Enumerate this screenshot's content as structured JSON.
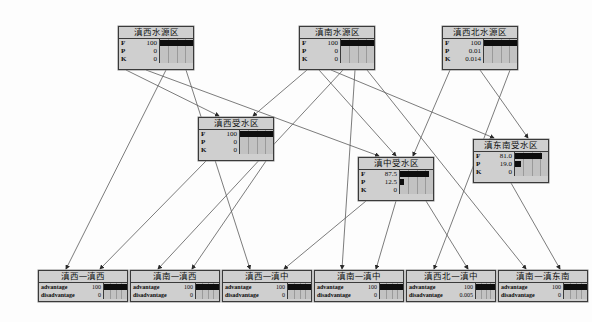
{
  "diagram": {
    "type": "bayesian-network",
    "title": "",
    "background_color": "#fdfdfd",
    "node_fill": "#cfcfcf",
    "node_border": "#3a3a3a",
    "bar_color": "#0d0d0d",
    "edge_color": "#5a5a5a"
  },
  "nodes": [
    {
      "id": "n1",
      "name": "滇西水源区",
      "x": 118,
      "y": 26,
      "w": 76,
      "h": 44,
      "label_w": 14,
      "value_w": 26,
      "states": [
        {
          "label": "F",
          "value": "100",
          "pct": 100
        },
        {
          "label": "P",
          "value": "0",
          "pct": 0
        },
        {
          "label": "K",
          "value": "0",
          "pct": 0
        }
      ]
    },
    {
      "id": "n2",
      "name": "滇南水源区",
      "x": 299,
      "y": 26,
      "w": 76,
      "h": 44,
      "label_w": 14,
      "value_w": 26,
      "states": [
        {
          "label": "F",
          "value": "100",
          "pct": 100
        },
        {
          "label": "P",
          "value": "0",
          "pct": 0
        },
        {
          "label": "K",
          "value": "0",
          "pct": 0
        }
      ]
    },
    {
      "id": "n3",
      "name": "滇西北水源区",
      "x": 442,
      "y": 26,
      "w": 76,
      "h": 44,
      "label_w": 12,
      "value_w": 28,
      "states": [
        {
          "label": "F",
          "value": "100",
          "pct": 100
        },
        {
          "label": "P",
          "value": "0.01",
          "pct": 0
        },
        {
          "label": "K",
          "value": "0.014",
          "pct": 0
        }
      ]
    },
    {
      "id": "n4",
      "name": "滇西受水区",
      "x": 198,
      "y": 117,
      "w": 76,
      "h": 44,
      "label_w": 14,
      "value_w": 26,
      "states": [
        {
          "label": "F",
          "value": "100",
          "pct": 100
        },
        {
          "label": "P",
          "value": "0",
          "pct": 0
        },
        {
          "label": "K",
          "value": "0",
          "pct": 0
        }
      ]
    },
    {
      "id": "n5",
      "name": "滇中受水区",
      "x": 358,
      "y": 157,
      "w": 76,
      "h": 44,
      "label_w": 14,
      "value_w": 26,
      "states": [
        {
          "label": "F",
          "value": "87.5",
          "pct": 87.5
        },
        {
          "label": "P",
          "value": "12.5",
          "pct": 12.5
        },
        {
          "label": "K",
          "value": "0",
          "pct": 0
        }
      ]
    },
    {
      "id": "n6",
      "name": "滇东南受水区",
      "x": 473,
      "y": 139,
      "w": 76,
      "h": 44,
      "label_w": 12,
      "value_w": 28,
      "states": [
        {
          "label": "F",
          "value": "81.0",
          "pct": 81
        },
        {
          "label": "P",
          "value": "19.0",
          "pct": 19
        },
        {
          "label": "K",
          "value": "0",
          "pct": 0
        }
      ]
    },
    {
      "id": "b1",
      "name": "滇西—滇西",
      "x": 38,
      "y": 270,
      "w": 90,
      "h": 32,
      "wide": true,
      "label_w": 42,
      "value_w": 22,
      "states": [
        {
          "label": "advantage",
          "value": "100",
          "pct": 100
        },
        {
          "label": "disadvantage",
          "value": "0",
          "pct": 0
        }
      ]
    },
    {
      "id": "b2",
      "name": "滇南—滇西",
      "x": 130,
      "y": 270,
      "w": 90,
      "h": 32,
      "wide": true,
      "label_w": 42,
      "value_w": 22,
      "states": [
        {
          "label": "advantage",
          "value": "100",
          "pct": 100
        },
        {
          "label": "disadvantage",
          "value": "0",
          "pct": 0
        }
      ]
    },
    {
      "id": "b3",
      "name": "滇西—滇中",
      "x": 222,
      "y": 270,
      "w": 90,
      "h": 32,
      "wide": true,
      "label_w": 42,
      "value_w": 22,
      "states": [
        {
          "label": "advantage",
          "value": "100",
          "pct": 100
        },
        {
          "label": "disadvantage",
          "value": "0",
          "pct": 0
        }
      ]
    },
    {
      "id": "b4",
      "name": "滇南—滇中",
      "x": 314,
      "y": 270,
      "w": 90,
      "h": 32,
      "wide": true,
      "label_w": 42,
      "value_w": 22,
      "states": [
        {
          "label": "advantage",
          "value": "100",
          "pct": 100
        },
        {
          "label": "disadvantage",
          "value": "0",
          "pct": 0
        }
      ]
    },
    {
      "id": "b5",
      "name": "滇西北—滇中",
      "x": 406,
      "y": 270,
      "w": 90,
      "h": 32,
      "wide": true,
      "label_w": 42,
      "value_w": 26,
      "states": [
        {
          "label": "advantage",
          "value": "100",
          "pct": 100
        },
        {
          "label": "disadvantage",
          "value": "0.005",
          "pct": 0
        }
      ]
    },
    {
      "id": "b6",
      "name": "滇南—滇东南",
      "x": 498,
      "y": 270,
      "w": 90,
      "h": 32,
      "wide": true,
      "label_w": 42,
      "value_w": 22,
      "states": [
        {
          "label": "advantage",
          "value": "100",
          "pct": 100
        },
        {
          "label": "disadvantage",
          "value": "0",
          "pct": 0
        }
      ]
    }
  ],
  "edges": [
    {
      "from": "n1",
      "to": "n4"
    },
    {
      "from": "n1",
      "to": "n5"
    },
    {
      "from": "n1",
      "to": "b1"
    },
    {
      "from": "n1",
      "to": "b3"
    },
    {
      "from": "n2",
      "to": "n4"
    },
    {
      "from": "n2",
      "to": "n5"
    },
    {
      "from": "n2",
      "to": "n6"
    },
    {
      "from": "n2",
      "to": "b2"
    },
    {
      "from": "n2",
      "to": "b4"
    },
    {
      "from": "n2",
      "to": "b6"
    },
    {
      "from": "n3",
      "to": "n5"
    },
    {
      "from": "n3",
      "to": "n6"
    },
    {
      "from": "n3",
      "to": "b5"
    },
    {
      "from": "n4",
      "to": "b1"
    },
    {
      "from": "n4",
      "to": "b2"
    },
    {
      "from": "n5",
      "to": "b3"
    },
    {
      "from": "n5",
      "to": "b4"
    },
    {
      "from": "n5",
      "to": "b5"
    },
    {
      "from": "n6",
      "to": "b6"
    }
  ]
}
